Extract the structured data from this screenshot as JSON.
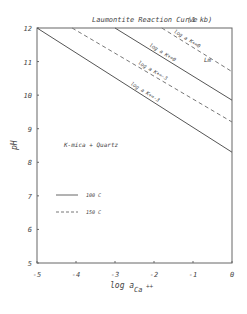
{
  "chart_data": {
    "type": "line",
    "title": "Laumontite Reaction Curve",
    "subtitle": "(1 kb)",
    "xlabel": "log a Ca++",
    "xlabel_main": "log a",
    "xlabel_sub": "Ca",
    "xlabel_sup": "++",
    "ylabel": "pH",
    "xlim": [
      -5,
      0
    ],
    "ylim": [
      5,
      12
    ],
    "xticks": [
      "-5",
      "-4",
      "-3",
      "-2",
      "-1",
      "0"
    ],
    "yticks": [
      "5",
      "6",
      "7",
      "8",
      "9",
      "10",
      "11",
      "12"
    ],
    "grid": false,
    "legend": [
      {
        "label": "100 C",
        "style": "solid"
      },
      {
        "label": "150 C",
        "style": "dashed"
      }
    ],
    "series": [
      {
        "name": "log a K+ = -3 (100 C)",
        "label": "log a K+=-3",
        "style": "solid",
        "points": [
          [
            -5,
            12
          ],
          [
            0,
            8.3
          ]
        ]
      },
      {
        "name": "log a K+ = -3 (150 C)",
        "label": "log a K+=-3",
        "style": "dashed",
        "points": [
          [
            -4.1,
            12
          ],
          [
            0,
            9.2
          ]
        ]
      },
      {
        "name": "log a K+ = 0 (100 C)",
        "label": "log a K+=0",
        "style": "solid",
        "points": [
          [
            -3.0,
            12
          ],
          [
            0,
            9.85
          ]
        ]
      },
      {
        "name": "log a K+ = 0 (150 C)",
        "label": "log a K+=0",
        "style": "dashed",
        "points": [
          [
            -1.8,
            12
          ],
          [
            0,
            10.7
          ]
        ]
      }
    ],
    "annotations": [
      {
        "text": "K-mica + Quartz",
        "x": -3.4,
        "y": 8.9
      },
      {
        "text": "Lm",
        "x": -0.5,
        "y": 11.55
      }
    ]
  }
}
